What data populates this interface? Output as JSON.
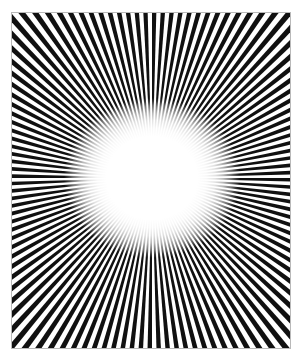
{
  "artwork": {
    "title": "Radial Ray Burst Optical Illusion",
    "type": "op-art-radial-burst",
    "background_color": "#ffffff",
    "ray_color": "#101010",
    "frame": {
      "border_color": "#b9b9b9",
      "border_width": 1,
      "left": 12,
      "top": 13,
      "width": 278,
      "height": 335
    },
    "canvas": {
      "width": 302,
      "height": 364
    },
    "rays": {
      "count": 120,
      "origin_x": 140,
      "origin_y": 165,
      "angular_duty_cycle": 0.5,
      "start_angle_deg": 0
    },
    "center_void": {
      "shape": "ellipse",
      "center_x": 140,
      "center_y": 165,
      "radius_x": 88,
      "radius_y": 80,
      "solid_white_stop_pct": 52,
      "fade_end_stop_pct": 100
    }
  },
  "chart_data": {
    "type": "scatter",
    "xlabel": "",
    "ylabel": "",
    "categories": [
      "ray-spokes",
      "center-void",
      "frame-border"
    ],
    "values": [
      120,
      1,
      1
    ],
    "legend_position": "none",
    "grid": false
  }
}
